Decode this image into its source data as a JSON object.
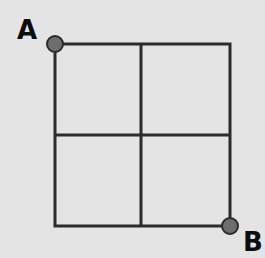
{
  "diagram": {
    "type": "grid",
    "rows": 2,
    "cols": 2,
    "grid_color": "#2b2b2b",
    "point_color": "#6e6e6e",
    "background": "#e4e4e4",
    "points": [
      {
        "id": "A",
        "label": "A",
        "position": "top-left corner"
      },
      {
        "id": "B",
        "label": "B",
        "position": "bottom-right corner"
      }
    ]
  }
}
